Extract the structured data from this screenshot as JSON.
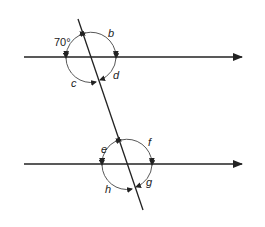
{
  "diagram": {
    "type": "parallel-lines-transversal",
    "colors": {
      "line": "#222222",
      "background": "#ffffff"
    },
    "parallel_lines": [
      {
        "id": "top",
        "y": 57,
        "x_start": 24,
        "x_end": 242,
        "arrow": "right"
      },
      {
        "id": "bottom",
        "y": 164,
        "x_start": 24,
        "x_end": 242,
        "arrow": "right"
      }
    ],
    "transversal": {
      "x1": 78,
      "y1": 19,
      "x2": 143,
      "y2": 210
    },
    "intersections": [
      {
        "id": "upper",
        "cx": 91,
        "cy": 57,
        "r": 25
      },
      {
        "id": "lower",
        "cx": 127,
        "cy": 164,
        "r": 25
      }
    ],
    "angle_labels": {
      "given": "70°",
      "b": "b",
      "c": "c",
      "d": "d",
      "e": "e",
      "f": "f",
      "g": "g",
      "h": "h"
    }
  }
}
